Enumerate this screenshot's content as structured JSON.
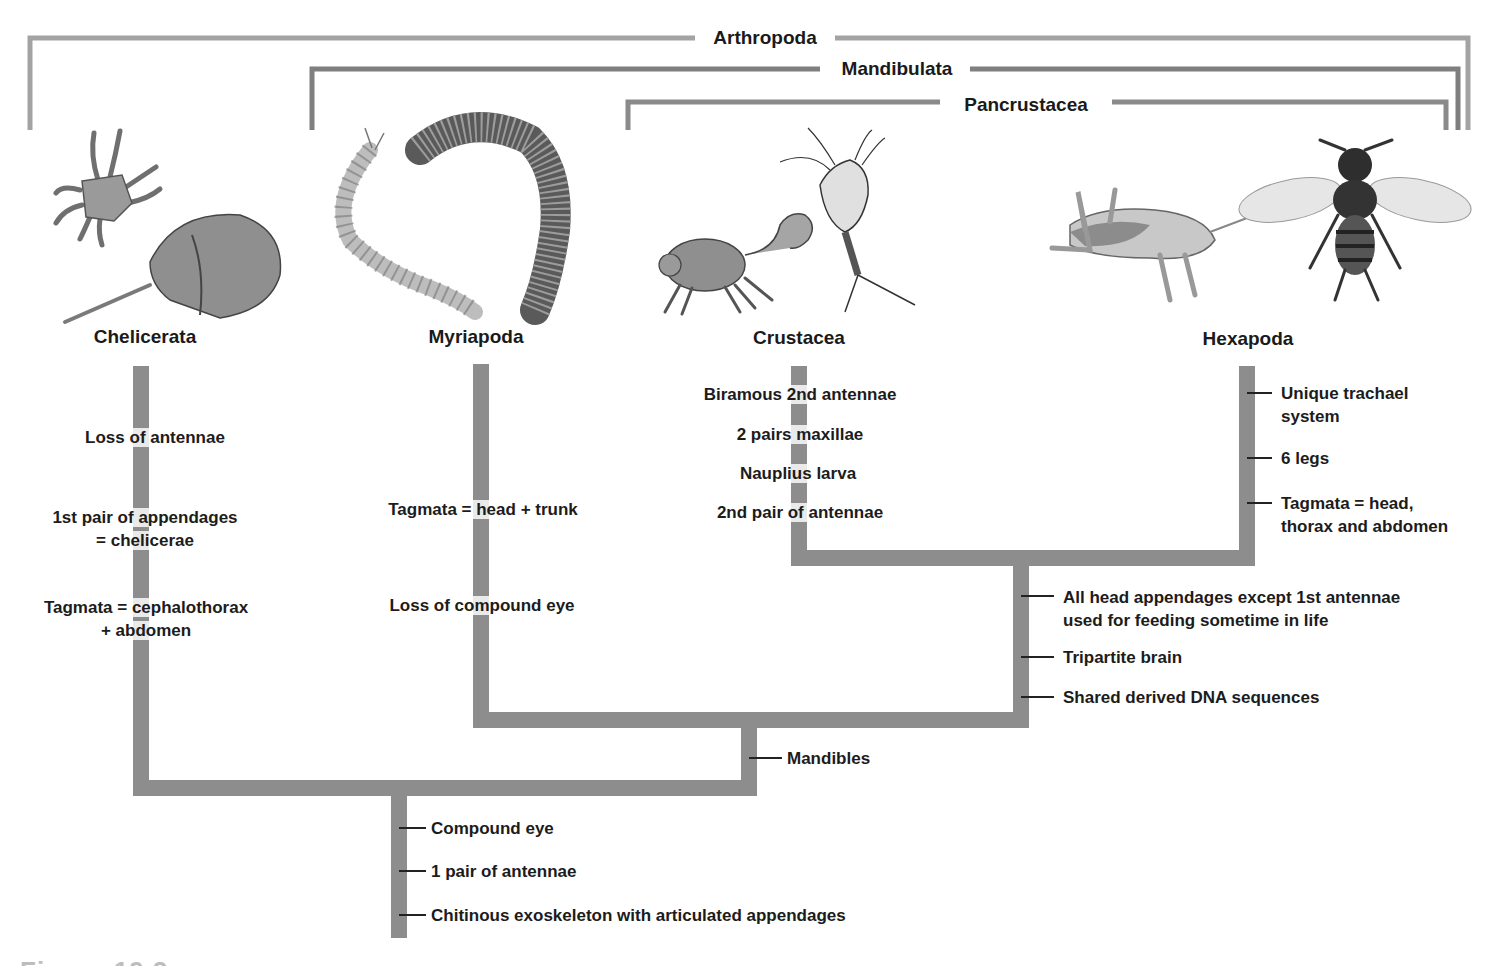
{
  "clades": {
    "arthropoda": "Arthropoda",
    "mandibulata": "Mandibulata",
    "pancrustacea": "Pancrustacea"
  },
  "taxa": [
    {
      "id": "chelicerata",
      "label": "Chelicerata",
      "icons": [
        "mite-icon",
        "horseshoe-crab-icon"
      ]
    },
    {
      "id": "myriapoda",
      "label": "Myriapoda",
      "icons": [
        "centipede-icon",
        "millipede-icon"
      ]
    },
    {
      "id": "crustacea",
      "label": "Crustacea",
      "icons": [
        "crab-icon",
        "copepod-icon"
      ]
    },
    {
      "id": "hexapoda",
      "label": "Hexapoda",
      "icons": [
        "grasshopper-icon",
        "bee-icon"
      ]
    }
  ],
  "traits": {
    "chelicerata": [
      "Loss of antennae",
      "1st pair of appendages",
      "= chelicerae",
      "Tagmata = cephalothorax",
      "+ abdomen"
    ],
    "myriapoda": [
      "Tagmata = head + trunk",
      "Loss of compound eye"
    ],
    "crustacea": [
      "Biramous 2nd antennae",
      "2 pairs maxillae",
      "Nauplius larva",
      "2nd pair of antennae"
    ],
    "hexapoda": [
      "Unique trachael",
      "system",
      "6 legs",
      "Tagmata = head,",
      "thorax and abdomen"
    ],
    "pancrustacea_node": [
      "All head appendages except 1st antennae",
      "used for feeding sometime in life",
      "Tripartite brain",
      "Shared derived DNA sequences"
    ],
    "mandibulata_node": [
      "Mandibles"
    ],
    "arthropoda_root": [
      "Compound eye",
      "1 pair of antennae",
      "Chitinous exoskeleton with articulated appendages"
    ]
  },
  "colors": {
    "branch": "#8c8c8c",
    "bracket_light": "#a0a0a0",
    "bracket_dark": "#7a7a7a",
    "text": "#1c1c1c"
  },
  "caption_partial": "Figure 19.2"
}
